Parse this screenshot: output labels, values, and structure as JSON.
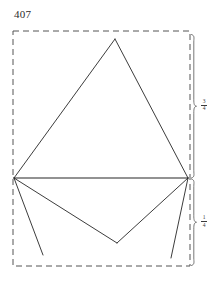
{
  "figure": {
    "number_label": "407",
    "background_color": "#ffffff",
    "line_color": "#262626",
    "dashed_color": "#555555",
    "brace_color": "#555555"
  },
  "bounding_box": {
    "style": "dashed",
    "left": 13,
    "top": 31,
    "right": 190,
    "bottom": 266
  },
  "points": {
    "apex_top": {
      "x": 115,
      "y": 39
    },
    "left_vertex": {
      "x": 14,
      "y": 178
    },
    "right_vertex": {
      "x": 188,
      "y": 178
    },
    "lower_apex": {
      "x": 117,
      "y": 243
    },
    "left_tail_end": {
      "x": 43,
      "y": 255
    },
    "right_tail_end": {
      "x": 171,
      "y": 258
    }
  },
  "strokes": [
    {
      "name": "upper-triangle-left-side",
      "from": "left_vertex",
      "to": "apex_top"
    },
    {
      "name": "upper-triangle-right-side",
      "from": "apex_top",
      "to": "right_vertex"
    },
    {
      "name": "horizontal-base-line",
      "from": "left_vertex",
      "to": "right_vertex"
    },
    {
      "name": "lower-fold-left",
      "from": "left_vertex",
      "to": "lower_apex"
    },
    {
      "name": "lower-fold-right",
      "from": "lower_apex",
      "to": "right_vertex"
    },
    {
      "name": "left-tail-line",
      "from": "left_vertex",
      "to": "left_tail_end"
    },
    {
      "name": "right-tail-line",
      "from": "right_vertex",
      "to": "right_tail_end"
    }
  ],
  "dimensions": {
    "upper": {
      "label_name": "upper-dimension-fraction",
      "numerator": "3",
      "denominator": "4",
      "span_top": 33,
      "span_bottom": 178
    },
    "lower": {
      "label_name": "lower-dimension-fraction",
      "numerator": "1",
      "denominator": "4",
      "span_top": 178,
      "span_bottom": 266
    }
  }
}
